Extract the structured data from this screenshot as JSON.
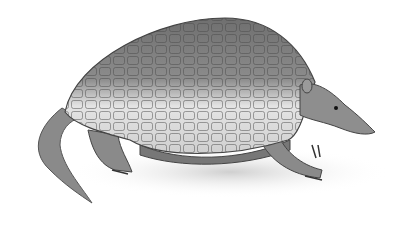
{
  "image": {
    "subject": "armadillo illustration",
    "style": "grayscale pencil drawing",
    "background": "#ffffff",
    "colors": {
      "shell_dark": "#6a6a6a",
      "shell_light": "#e6e6e6",
      "skin": "#8a8a8a",
      "ground": "#d8d8d8"
    }
  }
}
